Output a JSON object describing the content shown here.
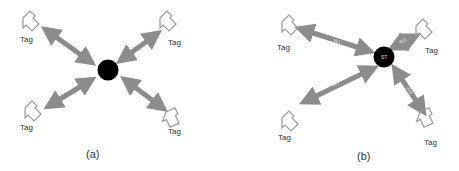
{
  "panel_a": {
    "caption": "(a)",
    "tags": [
      {
        "label": "Tag"
      },
      {
        "label": "Tag"
      },
      {
        "label": "Tag"
      },
      {
        "label": "Tag"
      }
    ],
    "center_label": ""
  },
  "panel_b": {
    "caption": "(b)",
    "center_label": "ST",
    "tags": [
      {
        "label": "Tag"
      },
      {
        "label": "Tag"
      },
      {
        "label": "Tag"
      },
      {
        "label": "Tag"
      }
    ],
    "links": [
      {
        "label": "W1"
      },
      {
        "label": "W2"
      },
      {
        "label": "W3"
      },
      {
        "label": "W4"
      }
    ]
  },
  "colors": {
    "arrow": "#8c8c8c",
    "node": "#000000",
    "tag_outline": "#9a9a9a"
  }
}
